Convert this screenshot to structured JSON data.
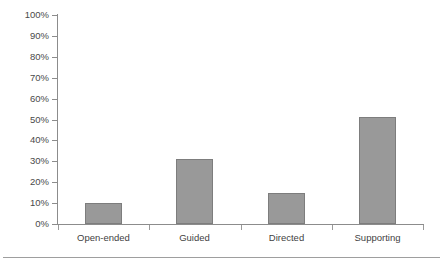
{
  "chart_data": {
    "type": "bar",
    "title": "",
    "subtitle": "",
    "xlabel": "",
    "ylabel": "",
    "categories": [
      "Open-ended",
      "Guided",
      "Directed",
      "Supporting"
    ],
    "values": [
      10,
      31,
      15,
      51
    ],
    "value_labels": [
      "10%",
      "31%",
      "15%",
      "51%"
    ],
    "ylim": [
      0,
      100
    ],
    "ytick_labels": [
      "0%",
      "10%",
      "20%",
      "30%",
      "40%",
      "50%",
      "60%",
      "70%",
      "80%",
      "90%",
      "100%"
    ],
    "ytick_values": [
      0,
      10,
      20,
      30,
      40,
      50,
      60,
      70,
      80,
      90,
      100
    ],
    "grid": false,
    "legend": null,
    "series": [
      {
        "name": "",
        "values": [
          10,
          31,
          15,
          51
        ]
      }
    ],
    "colors": {
      "bar_fill": "#999999",
      "bar_border": "#7d7d7d",
      "axis": "#8c8c8c",
      "text": "#3f3f3f",
      "background": "#ffffff",
      "footer_rule": "#9e9e9e"
    }
  }
}
